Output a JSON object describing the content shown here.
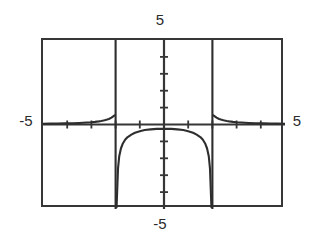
{
  "figure": {
    "kind": "graphing-calculator-plot",
    "background_color": "#ffffff",
    "ink_color": "#363636"
  },
  "labels": {
    "top": "5",
    "bottom": "-5",
    "left": "-5",
    "right": "5"
  },
  "chart_data": {
    "type": "line",
    "title": "",
    "subtitle": "",
    "xlabel": "",
    "ylabel": "",
    "xlim": [
      -5,
      5
    ],
    "ylim": [
      -5,
      5
    ],
    "grid": false,
    "legend": null,
    "axes": {
      "x_axis_y_value": 0,
      "y_axis_x_value": 0,
      "x_tick_interval": 1,
      "y_tick_interval": 1,
      "x_ticks": [
        -4,
        -3,
        -2,
        -1,
        1,
        2,
        3,
        4
      ],
      "y_ticks": [
        -4,
        -3,
        -2,
        -1,
        1,
        2,
        3,
        4
      ],
      "tick_labels_shown": false,
      "corner_labels": [
        "-5",
        "5",
        "-5",
        "5"
      ]
    },
    "asymptotes": {
      "vertical": [
        -2,
        2
      ],
      "horizontal": [
        0
      ]
    },
    "annotations": [
      "Rational function with vertical asymptotes at x = -2 and x = 2",
      "Horizontal asymptote y = 0",
      "Outer branches positive, approaching y = 0 from above",
      "Middle branch negative, local maximum near (0, -0.25)"
    ],
    "series": [
      {
        "name": "left-outer-branch",
        "x": [
          -5.0,
          -4.7,
          -4.4,
          -4.1,
          -3.8,
          -3.5,
          -3.2,
          -3.0,
          -2.85,
          -2.7,
          -2.6,
          -2.5,
          -2.42,
          -2.35,
          -2.28,
          -2.22,
          -2.17,
          -2.13,
          -2.1,
          -2.07,
          -2.05,
          -2.04
        ],
        "y": [
          0.048,
          0.051,
          0.057,
          0.065,
          0.076,
          0.091,
          0.114,
          0.133,
          0.156,
          0.185,
          0.208,
          0.235,
          0.264,
          0.293,
          0.327,
          0.368,
          0.406,
          0.446,
          0.478,
          0.513,
          0.536,
          0.548
        ]
      },
      {
        "name": "middle-branch",
        "x": [
          -1.96,
          -1.9,
          -1.85,
          -1.78,
          -1.7,
          -1.6,
          -1.5,
          -1.35,
          -1.2,
          -1.0,
          -0.8,
          -0.55,
          -0.3,
          0.0,
          0.3,
          0.55,
          0.8,
          1.0,
          1.2,
          1.35,
          1.5,
          1.6,
          1.7,
          1.78,
          1.85,
          1.9,
          1.96
        ],
        "y": [
          -4.9,
          -2.6,
          -1.88,
          -1.42,
          -1.12,
          -0.89,
          -0.74,
          -0.6,
          -0.49,
          -0.4,
          -0.33,
          -0.29,
          -0.26,
          -0.25,
          -0.26,
          -0.29,
          -0.33,
          -0.4,
          -0.49,
          -0.6,
          -0.74,
          -0.89,
          -1.12,
          -1.42,
          -1.88,
          -2.6,
          -4.9
        ]
      },
      {
        "name": "right-outer-branch",
        "x": [
          2.04,
          2.05,
          2.07,
          2.1,
          2.13,
          2.17,
          2.22,
          2.28,
          2.35,
          2.42,
          2.5,
          2.6,
          2.7,
          2.85,
          3.0,
          3.2,
          3.5,
          3.8,
          4.1,
          4.4,
          4.7,
          5.0
        ],
        "y": [
          0.548,
          0.536,
          0.513,
          0.478,
          0.446,
          0.406,
          0.368,
          0.327,
          0.293,
          0.264,
          0.235,
          0.208,
          0.185,
          0.156,
          0.133,
          0.114,
          0.091,
          0.076,
          0.065,
          0.057,
          0.051,
          0.048
        ]
      }
    ]
  }
}
